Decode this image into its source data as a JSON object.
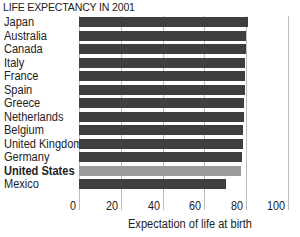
{
  "chart_data": {
    "type": "bar",
    "orientation": "horizontal",
    "title": "LIFE EXPECTANCY IN 2001",
    "xlabel": "Expectation of life at birth",
    "ylabel": "",
    "xlim": [
      0,
      100
    ],
    "xticks": [
      0,
      20,
      40,
      60,
      80,
      100
    ],
    "grid": true,
    "legend": null,
    "highlight": "United States",
    "categories": [
      "Japan",
      "Australia",
      "Canada",
      "Italy",
      "France",
      "Spain",
      "Greece",
      "Netherlands",
      "Belgium",
      "United Kingdom",
      "Germany",
      "United States",
      "Mexico"
    ],
    "values": [
      81.0,
      80.0,
      79.8,
      79.6,
      79.4,
      79.2,
      79.0,
      78.8,
      78.6,
      78.4,
      78.2,
      77.3,
      70.5
    ],
    "colors": {
      "default": "#3f3f3f",
      "highlight": "#9a9a9a",
      "grid": "#bdbdbd"
    }
  },
  "tick_labels": [
    "0",
    "20",
    "40",
    "60",
    "80",
    "100"
  ]
}
